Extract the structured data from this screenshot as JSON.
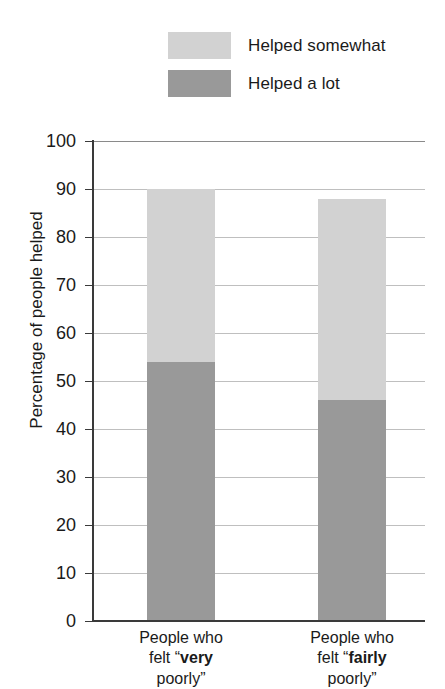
{
  "chart_data": {
    "type": "bar",
    "subtype": "stacked-bar",
    "title": "",
    "xlabel": "",
    "ylabel": "Percentage of people helped",
    "ylim": [
      0,
      100
    ],
    "ytick_step": 10,
    "yticks": [
      100,
      90,
      80,
      70,
      60,
      50,
      40,
      30,
      20,
      10,
      0
    ],
    "grid": true,
    "legend_position": "top",
    "categories": [
      "People who felt “very poorly”",
      "People who felt “fairly poorly”"
    ],
    "series": [
      {
        "name": "Helped somewhat",
        "values": [
          36,
          42
        ],
        "color": "#d2d2d2"
      },
      {
        "name": "Helped a lot",
        "values": [
          54,
          46
        ],
        "color": "#999999"
      }
    ],
    "totals": [
      90,
      88
    ]
  },
  "legend": {
    "items": [
      {
        "label": "Helped somewhat",
        "color": "#d2d2d2"
      },
      {
        "label": "Helped a lot",
        "color": "#999999"
      }
    ]
  },
  "axis": {
    "y_title": "Percentage of people helped",
    "y_ticks": [
      "100",
      "90",
      "80",
      "70",
      "60",
      "50",
      "40",
      "30",
      "20",
      "10",
      "0"
    ]
  },
  "x_labels": [
    {
      "line1": "People who",
      "line2_pre": "felt “",
      "line2_bold": "very",
      "line3": "poorly”"
    },
    {
      "line1": "People who",
      "line2_pre": "felt “",
      "line2_bold": "fairly",
      "line3": "poorly”"
    }
  ],
  "colors": {
    "helped_somewhat": "#d2d2d2",
    "helped_a_lot": "#999999",
    "axis": "#3a3a3a",
    "gridline": "#bfbfbf",
    "background": "#ffffff"
  }
}
